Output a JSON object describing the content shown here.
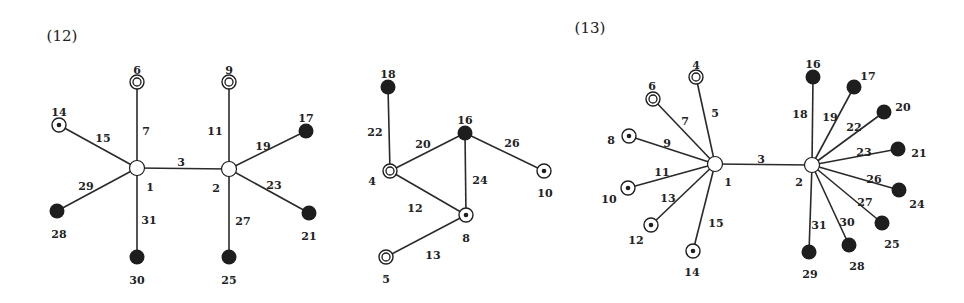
{
  "figures": [
    {
      "id": "12",
      "title": "(12)",
      "title_pos": [
        62,
        41
      ],
      "nodes": [
        {
          "id": "1",
          "x": 137,
          "y": 168,
          "type": "hub",
          "lx": 150,
          "ly": 187
        },
        {
          "id": "2",
          "x": 229,
          "y": 169,
          "type": "hub",
          "lx": 216,
          "ly": 188
        },
        {
          "id": "6",
          "x": 137,
          "y": 82,
          "type": "double",
          "lx": 137,
          "ly": 70
        },
        {
          "id": "9",
          "x": 229,
          "y": 82,
          "type": "double",
          "lx": 229,
          "ly": 70
        },
        {
          "id": "14",
          "x": 59,
          "y": 125,
          "type": "dot",
          "lx": 59,
          "ly": 112
        },
        {
          "id": "17",
          "x": 306,
          "y": 131,
          "type": "filled",
          "lx": 306,
          "ly": 118
        },
        {
          "id": "28",
          "x": 57,
          "y": 211,
          "type": "filled",
          "lx": 59,
          "ly": 234
        },
        {
          "id": "21",
          "x": 309,
          "y": 213,
          "type": "filled",
          "lx": 309,
          "ly": 236
        },
        {
          "id": "30",
          "x": 137,
          "y": 257,
          "type": "filled",
          "lx": 137,
          "ly": 280
        },
        {
          "id": "25",
          "x": 229,
          "y": 257,
          "type": "filled",
          "lx": 229,
          "ly": 280
        }
      ],
      "edges": [
        {
          "from": "1",
          "to": "2",
          "label": "3",
          "lx": 181,
          "ly": 162
        },
        {
          "from": "1",
          "to": "6",
          "label": "7",
          "lx": 146,
          "ly": 131
        },
        {
          "from": "2",
          "to": "9",
          "label": "11",
          "lx": 215,
          "ly": 131
        },
        {
          "from": "1",
          "to": "14",
          "label": "15",
          "lx": 103,
          "ly": 138
        },
        {
          "from": "2",
          "to": "17",
          "label": "19",
          "lx": 263,
          "ly": 146
        },
        {
          "from": "1",
          "to": "28",
          "label": "29",
          "lx": 86,
          "ly": 186
        },
        {
          "from": "2",
          "to": "21",
          "label": "23",
          "lx": 274,
          "ly": 185
        },
        {
          "from": "1",
          "to": "30",
          "label": "31",
          "lx": 149,
          "ly": 220
        },
        {
          "from": "2",
          "to": "25",
          "label": "27",
          "lx": 243,
          "ly": 221
        }
      ]
    },
    {
      "id": "12b",
      "title": "",
      "nodes": [
        {
          "id": "18",
          "x": 388,
          "y": 87,
          "type": "filled",
          "lx": 388,
          "ly": 74
        },
        {
          "id": "16",
          "x": 465,
          "y": 133,
          "type": "filled",
          "lx": 465,
          "ly": 120
        },
        {
          "id": "4",
          "x": 390,
          "y": 171,
          "type": "double",
          "lx": 372,
          "ly": 181
        },
        {
          "id": "10",
          "x": 544,
          "y": 171,
          "type": "dot",
          "lx": 545,
          "ly": 193
        },
        {
          "id": "8",
          "x": 466,
          "y": 215,
          "type": "dot",
          "lx": 466,
          "ly": 238
        },
        {
          "id": "5",
          "x": 386,
          "y": 257,
          "type": "double",
          "lx": 386,
          "ly": 279
        }
      ],
      "edges": [
        {
          "from": "18",
          "to": "4",
          "label": "22",
          "lx": 375,
          "ly": 132
        },
        {
          "from": "4",
          "to": "16",
          "label": "20",
          "lx": 423,
          "ly": 144
        },
        {
          "from": "16",
          "to": "10",
          "label": "26",
          "lx": 512,
          "ly": 143
        },
        {
          "from": "16",
          "to": "8",
          "label": "24",
          "lx": 480,
          "ly": 180
        },
        {
          "from": "4",
          "to": "8",
          "label": "12",
          "lx": 415,
          "ly": 208
        },
        {
          "from": "8",
          "to": "5",
          "label": "13",
          "lx": 433,
          "ly": 255
        }
      ]
    },
    {
      "id": "13",
      "title": "(13)",
      "title_pos": [
        590,
        33
      ],
      "nodes": [
        {
          "id": "1",
          "x": 715,
          "y": 164,
          "type": "hub",
          "lx": 728,
          "ly": 182
        },
        {
          "id": "2",
          "x": 812,
          "y": 165,
          "type": "hub",
          "lx": 799,
          "ly": 182
        },
        {
          "id": "4",
          "x": 696,
          "y": 77,
          "type": "double",
          "lx": 696,
          "ly": 65
        },
        {
          "id": "6",
          "x": 653,
          "y": 99,
          "type": "double",
          "lx": 652,
          "ly": 86
        },
        {
          "id": "8",
          "x": 629,
          "y": 136,
          "type": "dot",
          "lx": 611,
          "ly": 140
        },
        {
          "id": "10",
          "x": 628,
          "y": 188,
          "type": "dot",
          "lx": 609,
          "ly": 199
        },
        {
          "id": "12",
          "x": 651,
          "y": 225,
          "type": "dot",
          "lx": 636,
          "ly": 240
        },
        {
          "id": "14",
          "x": 693,
          "y": 251,
          "type": "dot",
          "lx": 692,
          "ly": 272
        },
        {
          "id": "16",
          "x": 813,
          "y": 77,
          "type": "filled",
          "lx": 813,
          "ly": 64
        },
        {
          "id": "17",
          "x": 854,
          "y": 87,
          "type": "filled",
          "lx": 868,
          "ly": 76
        },
        {
          "id": "20",
          "x": 884,
          "y": 112,
          "type": "filled",
          "lx": 903,
          "ly": 107
        },
        {
          "id": "21",
          "x": 898,
          "y": 149,
          "type": "filled",
          "lx": 919,
          "ly": 153
        },
        {
          "id": "24",
          "x": 899,
          "y": 190,
          "type": "filled",
          "lx": 917,
          "ly": 204
        },
        {
          "id": "25",
          "x": 882,
          "y": 223,
          "type": "filled",
          "lx": 892,
          "ly": 244
        },
        {
          "id": "28",
          "x": 849,
          "y": 245,
          "type": "filled",
          "lx": 857,
          "ly": 266
        },
        {
          "id": "29",
          "x": 809,
          "y": 252,
          "type": "filled",
          "lx": 810,
          "ly": 274
        }
      ],
      "edges": [
        {
          "from": "1",
          "to": "2",
          "label": "3",
          "lx": 761,
          "ly": 159
        },
        {
          "from": "1",
          "to": "4",
          "label": "5",
          "lx": 715,
          "ly": 113
        },
        {
          "from": "1",
          "to": "6",
          "label": "7",
          "lx": 685,
          "ly": 121
        },
        {
          "from": "1",
          "to": "8",
          "label": "9",
          "lx": 667,
          "ly": 143
        },
        {
          "from": "1",
          "to": "10",
          "label": "11",
          "lx": 662,
          "ly": 172
        },
        {
          "from": "1",
          "to": "12",
          "label": "13",
          "lx": 668,
          "ly": 198
        },
        {
          "from": "1",
          "to": "14",
          "label": "15",
          "lx": 716,
          "ly": 223
        },
        {
          "from": "2",
          "to": "16",
          "label": "18",
          "lx": 800,
          "ly": 114
        },
        {
          "from": "2",
          "to": "17",
          "label": "19",
          "lx": 830,
          "ly": 117
        },
        {
          "from": "2",
          "to": "20",
          "label": "22",
          "lx": 854,
          "ly": 127
        },
        {
          "from": "2",
          "to": "21",
          "label": "23",
          "lx": 864,
          "ly": 152
        },
        {
          "from": "2",
          "to": "24",
          "label": "26",
          "lx": 874,
          "ly": 179
        },
        {
          "from": "2",
          "to": "25",
          "label": "27",
          "lx": 865,
          "ly": 202
        },
        {
          "from": "2",
          "to": "28",
          "label": "30",
          "lx": 847,
          "ly": 222
        },
        {
          "from": "2",
          "to": "29",
          "label": "31",
          "lx": 819,
          "ly": 225
        }
      ]
    }
  ],
  "legend_types": {
    "hub": "open circle",
    "double": "double circle",
    "dot": "circle with center dot",
    "filled": "filled black circle"
  },
  "colors": {
    "ink": "#1e1e1e",
    "background": "#ffffff"
  }
}
